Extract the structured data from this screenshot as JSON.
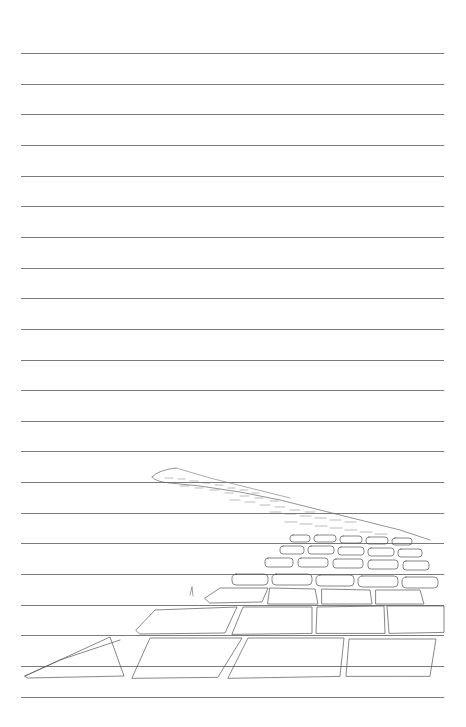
{
  "page": {
    "type": "lined-paper",
    "background": "#ffffff",
    "rule_color": "#7a7a7a",
    "rule_count": 22,
    "rule_start_y": 53,
    "rule_spacing": 30.65,
    "rule_left": 21,
    "rule_width": 423
  },
  "illustration": {
    "subject": "pencil sketch of a winding cobblestone path receding into the distance",
    "stroke_color": "#555555"
  }
}
